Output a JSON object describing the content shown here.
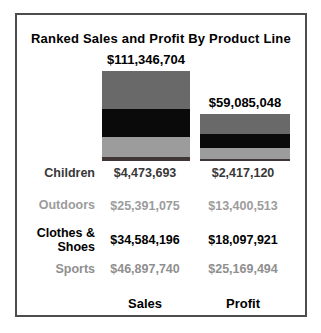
{
  "panel": {
    "background": "#ffffff",
    "border_color": "#4d4d4d"
  },
  "chart_data": {
    "type": "bar",
    "stacked": true,
    "title": "Ranked Sales and Profit By Product Line",
    "categories": [
      "Sales",
      "Profit"
    ],
    "series": [
      {
        "name": "Sports",
        "color": "#696969",
        "values": [
          46897740,
          25169494
        ]
      },
      {
        "name": "Clothes & Shoes",
        "color": "#0a0a0a",
        "values": [
          34584196,
          18097921
        ]
      },
      {
        "name": "Outdoors",
        "color": "#9c9c9c",
        "values": [
          25391075,
          13400513
        ]
      },
      {
        "name": "Children",
        "color": "#413636",
        "values": [
          4473693,
          2417120
        ]
      }
    ],
    "totals": [
      111346704,
      59085048
    ],
    "total_labels": [
      "$111,346,704",
      "$59,085,048"
    ],
    "px_per_million": 0.8,
    "ylim": [
      0,
      111346704
    ],
    "grid": false,
    "legend_position": "table-below"
  },
  "table": {
    "rows": [
      {
        "label": "Children",
        "sales": "$4,473,693",
        "profit": "$2,417,120",
        "color": "#383838"
      },
      {
        "label": "Outdoors",
        "sales": "$25,391,075",
        "profit": "$13,400,513",
        "color": "#9c9c9c"
      },
      {
        "label": "Clothes & Shoes",
        "sales": "$34,584,196",
        "profit": "$18,097,921",
        "color": "#000000"
      },
      {
        "label": "Sports",
        "sales": "$46,897,740",
        "profit": "$25,169,494",
        "color": "#8f8f8f"
      }
    ],
    "footer": {
      "sales": "Sales",
      "profit": "Profit"
    }
  }
}
